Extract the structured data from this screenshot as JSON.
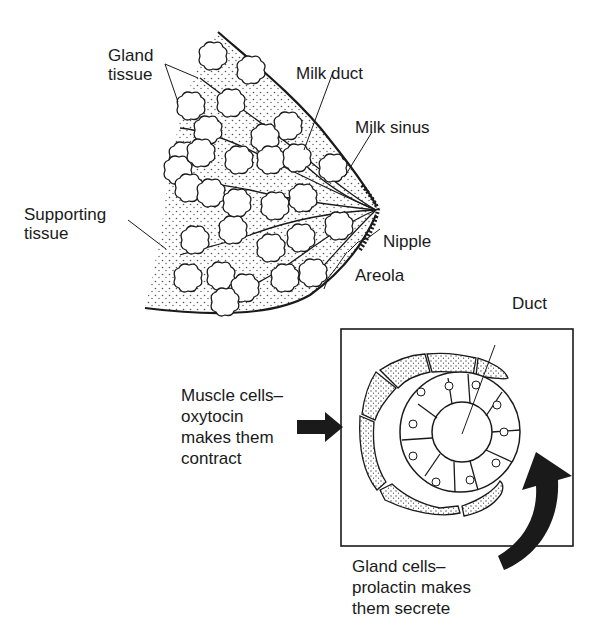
{
  "diagram": {
    "type": "anatomical illustration",
    "colors": {
      "ink": "#1a1a1a",
      "background": "#ffffff",
      "stipple": "#555555"
    }
  },
  "breast_labels": {
    "gland_tissue": "Gland\ntissue",
    "milk_duct": "Milk duct",
    "milk_sinus": "Milk sinus",
    "supporting_tissue": "Supporting\ntissue",
    "nipple": "Nipple",
    "areola": "Areola"
  },
  "inset_labels": {
    "duct": "Duct",
    "muscle_cells": "Muscle cells–\noxytocin\nmakes them\ncontract",
    "gland_cells": "Gland cells–\nprolactin makes\nthem secrete"
  }
}
